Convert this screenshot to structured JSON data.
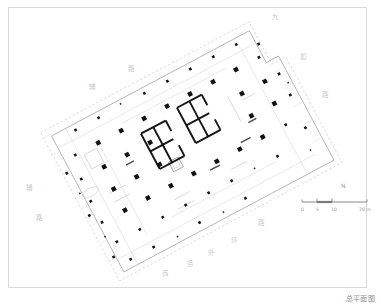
{
  "sheet": {
    "title": "总平面图",
    "frame_color": "#d8d8d8",
    "background": "#ffffff"
  },
  "map_labels": [
    {
      "text": "九",
      "x": 272,
      "y": 14,
      "faint": true
    },
    {
      "text": "如",
      "x": 300,
      "y": 54,
      "faint": true
    },
    {
      "text": "路",
      "x": 322,
      "y": 92,
      "faint": true
    },
    {
      "text": "路",
      "x": 128,
      "y": 66,
      "faint": true
    },
    {
      "text": "辅",
      "x": 89,
      "y": 84,
      "faint": true
    },
    {
      "text": "辅",
      "x": 26,
      "y": 185,
      "faint": true
    },
    {
      "text": "路",
      "x": 36,
      "y": 215,
      "faint": true
    },
    {
      "text": "路",
      "x": 258,
      "y": 220,
      "faint": true
    },
    {
      "text": "环",
      "x": 231,
      "y": 238,
      "faint": true
    },
    {
      "text": "外",
      "x": 208,
      "y": 250,
      "faint": true
    },
    {
      "text": "务",
      "x": 187,
      "y": 261,
      "faint": true
    },
    {
      "text": "商",
      "x": 162,
      "y": 271,
      "faint": true
    }
  ],
  "scale_bar": {
    "north_label": "N",
    "ticks": [
      {
        "label": "0",
        "x": 0
      },
      {
        "label": "5",
        "x": 15
      },
      {
        "label": "10",
        "x": 30
      },
      {
        "label": "20 m",
        "x": 58
      }
    ],
    "line_color": "#7a7a7a"
  },
  "plan": {
    "description": "rotated rectangular high-rise tower site plan with structural column grid and twin service cores",
    "rotation_deg": -28,
    "colors": {
      "column": "#111111",
      "core_wall": "#1a1a1a",
      "outline": "#9b9b9b",
      "thin_line": "#cfcfcf",
      "dashed": "#b5b5b5"
    },
    "column_grid": {
      "cols": 9,
      "rows": 6,
      "spacing_x": 24,
      "spacing_y": 22,
      "size_large": 4.2,
      "size_small": 2.4
    },
    "cores": [
      {
        "name": "core-left",
        "x": 156,
        "y": 118,
        "w": 30,
        "h": 30
      },
      {
        "name": "core-right",
        "x": 188,
        "y": 110,
        "w": 30,
        "h": 30
      }
    ]
  }
}
